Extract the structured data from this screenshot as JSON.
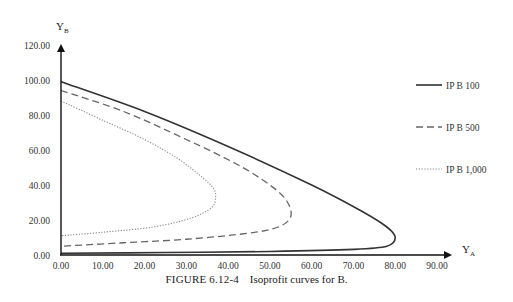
{
  "chart_data": {
    "type": "line",
    "title": "",
    "caption_label": "FIGURE 6.12-4",
    "caption_text": "Isoprofit curves for B.",
    "xlabel": "Y",
    "xlabel_sub": "A",
    "ylabel": "Y",
    "ylabel_sub": "B",
    "xlim": [
      0,
      90
    ],
    "ylim": [
      0,
      120
    ],
    "x_ticks": [
      "0.00",
      "10.00",
      "20.00",
      "30.00",
      "40.00",
      "50.00",
      "60.00",
      "70.00",
      "80.00",
      "90.00"
    ],
    "y_ticks": [
      "0.00",
      "20.00",
      "40.00",
      "60.00",
      "80.00",
      "100.00",
      "120.00"
    ],
    "grid": false,
    "legend_position": "right",
    "series": [
      {
        "name": "IP B 100",
        "style": "solid",
        "color": "#333333",
        "points": [
          [
            0,
            99
          ],
          [
            20,
            82
          ],
          [
            40,
            62
          ],
          [
            60,
            40
          ],
          [
            72,
            25
          ],
          [
            78,
            16
          ],
          [
            80,
            10
          ],
          [
            78,
            5
          ],
          [
            70,
            3.2
          ],
          [
            50,
            2
          ],
          [
            25,
            1.4
          ],
          [
            0,
            1
          ]
        ]
      },
      {
        "name": "IP B 500",
        "style": "dashed",
        "color": "#666666",
        "points": [
          [
            0,
            94
          ],
          [
            15,
            82
          ],
          [
            30,
            66
          ],
          [
            42,
            52
          ],
          [
            50,
            40
          ],
          [
            54,
            31
          ],
          [
            55,
            22
          ],
          [
            52,
            16
          ],
          [
            45,
            12.5
          ],
          [
            30,
            9
          ],
          [
            15,
            7
          ],
          [
            0,
            5
          ]
        ]
      },
      {
        "name": "IP B 1,000",
        "style": "dotted",
        "color": "#888888",
        "points": [
          [
            0,
            88
          ],
          [
            10,
            77
          ],
          [
            20,
            66
          ],
          [
            28,
            55
          ],
          [
            34,
            44
          ],
          [
            36.5,
            38
          ],
          [
            37,
            33
          ],
          [
            36,
            27
          ],
          [
            31,
            21
          ],
          [
            22,
            16
          ],
          [
            10,
            13
          ],
          [
            0,
            11
          ]
        ]
      }
    ]
  }
}
